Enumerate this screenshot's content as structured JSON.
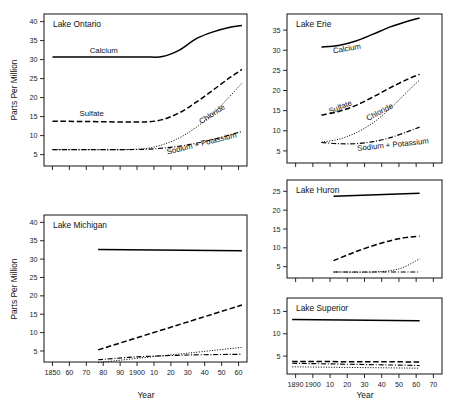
{
  "figure": {
    "axis_title_y": "Parts Per Million",
    "axis_title_x": "Year"
  },
  "chart_data": {
    "type": "line",
    "xlabel": "Year",
    "ylabel": "Parts Per Million",
    "grid": false,
    "legend": "inline-labels",
    "series_names": [
      "Calcium",
      "Sulfate",
      "Chloride",
      "Sodium + Potassium"
    ],
    "panels": [
      {
        "name": "Lake Ontario",
        "xlim": [
          1845,
          1965
        ],
        "ylim": [
          2,
          42
        ],
        "yticks": [
          5,
          10,
          15,
          20,
          25,
          30,
          35,
          40
        ],
        "xticks": [
          1850,
          1860,
          1870,
          1880,
          1890,
          1900,
          1910,
          1920,
          1930,
          1940,
          1950,
          1960
        ],
        "xticklabels": [
          "",
          "",
          "",
          "",
          "",
          "",
          "",
          "",
          "",
          "",
          "",
          ""
        ],
        "series": [
          {
            "name": "Calcium",
            "style": "solid",
            "x": [
              1850,
              1870,
              1890,
              1905,
              1915,
              1925,
              1935,
              1945,
              1955,
              1962
            ],
            "y": [
              30.7,
              30.7,
              30.7,
              30.7,
              30.8,
              32.5,
              35.5,
              37.3,
              38.5,
              39.0
            ]
          },
          {
            "name": "Sulfate",
            "style": "dashed",
            "x": [
              1850,
              1870,
              1890,
              1905,
              1915,
              1925,
              1935,
              1945,
              1955,
              1962
            ],
            "y": [
              13.8,
              13.7,
              13.6,
              13.6,
              14.2,
              16.0,
              18.8,
              22.0,
              25.3,
              27.4
            ]
          },
          {
            "name": "Chloride",
            "style": "dotted",
            "x": [
              1850,
              1870,
              1890,
              1905,
              1915,
              1925,
              1935,
              1945,
              1955,
              1962
            ],
            "y": [
              6.3,
              6.3,
              6.3,
              6.6,
              7.6,
              9.4,
              12.2,
              15.8,
              20.4,
              23.8
            ]
          },
          {
            "name": "Sodium + Potassium",
            "style": "dashdot",
            "x": [
              1850,
              1870,
              1890,
              1905,
              1915,
              1925,
              1935,
              1945,
              1955,
              1962
            ],
            "y": [
              6.3,
              6.3,
              6.3,
              6.4,
              6.7,
              7.2,
              8.0,
              9.0,
              10.2,
              11.1
            ]
          }
        ],
        "labels": [
          {
            "text": "Calcium",
            "x": 1872,
            "y": 31.8,
            "rotate": 0
          },
          {
            "text": "Sulfate",
            "x": 1866,
            "y": 15.1,
            "rotate": 0
          },
          {
            "text": "Chloride",
            "x": 1938,
            "y": 13.0,
            "rotate": -33
          },
          {
            "text": "Sodium + Potassium",
            "x": 1918,
            "y": 5.0,
            "rotate": -14
          }
        ]
      },
      {
        "name": "Lake Erie",
        "xlim": [
          1885,
          1975
        ],
        "ylim": [
          2,
          39
        ],
        "yticks": [
          5,
          10,
          15,
          20,
          25,
          30,
          35
        ],
        "xticks": [
          1890,
          1900,
          1910,
          1920,
          1930,
          1940,
          1950,
          1960,
          1970
        ],
        "xticklabels": [
          "",
          "",
          "",
          "",
          "",
          "",
          "",
          "",
          ""
        ],
        "series": [
          {
            "name": "Calcium",
            "style": "solid",
            "x": [
              1905,
              1915,
              1925,
              1935,
              1945,
              1955,
              1962
            ],
            "y": [
              30.8,
              31.2,
              32.3,
              34.0,
              35.8,
              37.2,
              38.0
            ]
          },
          {
            "name": "Sulfate",
            "style": "dashed",
            "x": [
              1905,
              1915,
              1925,
              1935,
              1945,
              1955,
              1962
            ],
            "y": [
              13.9,
              14.8,
              16.3,
              18.4,
              20.7,
              22.8,
              24.0
            ]
          },
          {
            "name": "Chloride",
            "style": "dotted",
            "x": [
              1905,
              1915,
              1925,
              1935,
              1945,
              1955,
              1962
            ],
            "y": [
              7.2,
              7.9,
              9.5,
              12.0,
              15.6,
              19.8,
              22.6
            ]
          },
          {
            "name": "Sodium + Potassium",
            "style": "dashdot",
            "x": [
              1905,
              1915,
              1925,
              1935,
              1945,
              1955,
              1962
            ],
            "y": [
              7.1,
              6.8,
              6.8,
              7.3,
              8.3,
              9.8,
              10.9
            ]
          }
        ],
        "labels": [
          {
            "text": "Calcium",
            "x": 1912,
            "y": 29.2,
            "rotate": -10
          },
          {
            "text": "Sulfate",
            "x": 1910,
            "y": 14.2,
            "rotate": -22
          },
          {
            "text": "Chloride",
            "x": 1932,
            "y": 12.4,
            "rotate": -28
          },
          {
            "text": "Sodium + Potassium",
            "x": 1926,
            "y": 5.0,
            "rotate": -6
          }
        ]
      },
      {
        "name": "Lake Michigan",
        "xlim": [
          1845,
          1965
        ],
        "ylim": [
          2,
          42
        ],
        "yticks": [
          5,
          10,
          15,
          20,
          25,
          30,
          35,
          40
        ],
        "xticks": [
          1850,
          1860,
          1870,
          1880,
          1890,
          1900,
          1910,
          1920,
          1930,
          1940,
          1950,
          1960
        ],
        "xticklabels": [
          "1850",
          "60",
          "70",
          "80",
          "90",
          "1900",
          "10",
          "20",
          "30",
          "40",
          "50",
          "60"
        ],
        "series": [
          {
            "name": "Calcium",
            "style": "solid",
            "x": [
              1877,
              1962
            ],
            "y": [
              32.6,
              32.3
            ]
          },
          {
            "name": "Sulfate",
            "style": "dashed",
            "x": [
              1877,
              1962
            ],
            "y": [
              5.3,
              17.5
            ]
          },
          {
            "name": "Chloride",
            "style": "dotted",
            "x": [
              1877,
              1900,
              1930,
              1962
            ],
            "y": [
              1.8,
              3.0,
              4.4,
              6.0
            ]
          },
          {
            "name": "Sodium + Potassium",
            "style": "dashdot",
            "x": [
              1877,
              1900,
              1930,
              1962
            ],
            "y": [
              2.6,
              3.4,
              3.9,
              4.1
            ]
          }
        ],
        "labels": []
      },
      {
        "name": "Lake Huron",
        "xlim": [
          1885,
          1975
        ],
        "ylim": [
          2,
          28
        ],
        "yticks": [
          5,
          10,
          15,
          20,
          25
        ],
        "xticks": [
          1890,
          1900,
          1910,
          1920,
          1930,
          1940,
          1950,
          1960,
          1970
        ],
        "xticklabels": [
          "",
          "",
          "",
          "",
          "",
          "",
          "",
          "",
          ""
        ],
        "series": [
          {
            "name": "Calcium",
            "style": "solid",
            "x": [
              1912,
              1962
            ],
            "y": [
              23.7,
              24.5
            ]
          },
          {
            "name": "Sulfate",
            "style": "dashed",
            "x": [
              1912,
              1925,
              1940,
              1952,
              1962
            ],
            "y": [
              6.6,
              9.0,
              11.3,
              12.6,
              13.1
            ]
          },
          {
            "name": "Chloride",
            "style": "dotted",
            "x": [
              1912,
              1935,
              1950,
              1962
            ],
            "y": [
              3.6,
              3.6,
              4.4,
              7.1
            ]
          },
          {
            "name": "Sodium + Potassium",
            "style": "dashdot",
            "x": [
              1912,
              1962
            ],
            "y": [
              3.6,
              3.6
            ]
          }
        ],
        "labels": []
      },
      {
        "name": "Lake Superior",
        "xlim": [
          1885,
          1975
        ],
        "ylim": [
          1,
          18
        ],
        "yticks": [
          5,
          10,
          15
        ],
        "xticks": [
          1890,
          1900,
          1910,
          1920,
          1930,
          1940,
          1950,
          1960,
          1970
        ],
        "xticklabels": [
          "1890",
          "1900",
          "10",
          "20",
          "30",
          "40",
          "50",
          "60",
          "70"
        ],
        "series": [
          {
            "name": "Calcium",
            "style": "solid",
            "x": [
              1888,
              1962
            ],
            "y": [
              13.2,
              12.9
            ]
          },
          {
            "name": "Sulfate",
            "style": "dashed",
            "x": [
              1888,
              1962
            ],
            "y": [
              3.8,
              3.7
            ]
          },
          {
            "name": "Chloride",
            "style": "dotted",
            "x": [
              1888,
              1962
            ],
            "y": [
              2.6,
              2.3
            ]
          },
          {
            "name": "Sodium + Potassium",
            "style": "dashdot",
            "x": [
              1888,
              1962
            ],
            "y": [
              3.4,
              2.9
            ]
          }
        ],
        "labels": []
      }
    ]
  }
}
